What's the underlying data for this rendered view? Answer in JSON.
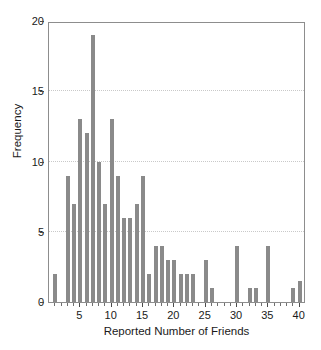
{
  "chart_data": {
    "type": "bar",
    "title": "",
    "subtitle": "",
    "xlabel": "Reported Number of Friends",
    "ylabel": "Frequency",
    "xlim": [
      0,
      41
    ],
    "ylim": [
      0,
      20
    ],
    "xticks": [
      5,
      10,
      15,
      20,
      25,
      30,
      35,
      40
    ],
    "yticks": [
      0,
      5,
      10,
      15,
      20
    ],
    "grid": "horizontal-dotted",
    "legend": "none",
    "bar_color": "#8a8a8a",
    "axis_color": "#8d8d8d",
    "grid_color": "#c9c9c9",
    "categories": [
      1,
      2,
      3,
      4,
      5,
      6,
      7,
      8,
      9,
      10,
      11,
      12,
      13,
      14,
      15,
      16,
      17,
      18,
      19,
      20,
      21,
      22,
      23,
      24,
      25,
      26,
      27,
      28,
      29,
      30,
      31,
      32,
      33,
      34,
      35,
      36,
      37,
      38,
      39,
      40
    ],
    "values": [
      2,
      0,
      9,
      7,
      13,
      12,
      19,
      10,
      7,
      13,
      9,
      6,
      6,
      7,
      9,
      2,
      4,
      4,
      3,
      3,
      2,
      2,
      2,
      0,
      3,
      1,
      0,
      0,
      0,
      4,
      0,
      1,
      1,
      0,
      4,
      0,
      0,
      0,
      1,
      1.5
    ],
    "annotations": []
  },
  "axes": {
    "y_tick_labels": [
      "0",
      "5",
      "10",
      "15",
      "20"
    ],
    "x_tick_labels": [
      "5",
      "10",
      "15",
      "20",
      "25",
      "30",
      "35",
      "40"
    ],
    "x_title": "Reported Number of Friends",
    "y_title": "Frequency"
  }
}
